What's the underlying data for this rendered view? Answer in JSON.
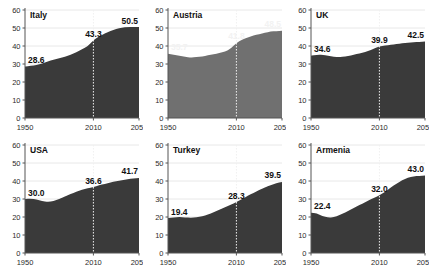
{
  "chart_data": {
    "type": "area",
    "title": "",
    "xlabel": "",
    "ylabel": "",
    "xlim": [
      1950,
      2050
    ],
    "ylim": [
      0,
      60
    ],
    "grid": true,
    "legend": "none",
    "xticks": [
      "1950",
      "2010",
      "2050"
    ],
    "xtick_values": [
      1950,
      2010,
      2050
    ],
    "yticks": [
      "0",
      "10",
      "20",
      "30",
      "40",
      "50",
      "60"
    ],
    "ytick_values": [
      0,
      10,
      20,
      30,
      40,
      50,
      60
    ],
    "reference_line_year": 2010,
    "label_years": [
      1950,
      2010,
      2050
    ],
    "colors": {
      "fill_dark": "#3a3a3a",
      "fill_light": "#707070",
      "label_dark": "#111111",
      "label_light": "#f2f2f2",
      "axis": "#555555",
      "grid": "#e8e8e8",
      "refline": "#f0f0f0"
    },
    "panels": [
      {
        "name": "Italy",
        "fill": "#3a3a3a",
        "label_color": "#111111",
        "labels": [
          "28.6",
          "43.3",
          "50.5"
        ],
        "label_values": [
          28.6,
          43.3,
          50.5
        ],
        "x": [
          1950,
          1955,
          1960,
          1965,
          1970,
          1975,
          1980,
          1985,
          1990,
          1995,
          2000,
          2005,
          2010,
          2015,
          2020,
          2025,
          2030,
          2035,
          2040,
          2045,
          2050
        ],
        "y": [
          28.6,
          29.0,
          29.4,
          30.2,
          31.4,
          32.4,
          33.2,
          34.0,
          35.2,
          36.6,
          38.2,
          39.8,
          43.3,
          45.3,
          47.0,
          48.3,
          49.4,
          50.2,
          50.6,
          50.6,
          50.5
        ]
      },
      {
        "name": "Austria",
        "fill": "#707070",
        "label_color": "#f2f2f2",
        "labels": [
          "35.7",
          "41.8",
          "48.5"
        ],
        "label_values": [
          35.7,
          41.8,
          48.5
        ],
        "x": [
          1950,
          1955,
          1960,
          1965,
          1970,
          1975,
          1980,
          1985,
          1990,
          1995,
          2000,
          2005,
          2010,
          2015,
          2020,
          2025,
          2030,
          2035,
          2040,
          2045,
          2050
        ],
        "y": [
          35.7,
          35.2,
          34.6,
          34.0,
          33.6,
          33.8,
          34.2,
          34.8,
          35.4,
          36.0,
          37.0,
          38.4,
          41.8,
          43.6,
          44.8,
          45.8,
          46.6,
          47.4,
          48.0,
          48.3,
          48.5
        ]
      },
      {
        "name": "UK",
        "fill": "#3a3a3a",
        "label_color": "#111111",
        "labels": [
          "34.6",
          "39.9",
          "42.5"
        ],
        "label_values": [
          34.6,
          39.9,
          42.5
        ],
        "x": [
          1950,
          1955,
          1960,
          1965,
          1970,
          1975,
          1980,
          1985,
          1990,
          1995,
          2000,
          2005,
          2010,
          2015,
          2020,
          2025,
          2030,
          2035,
          2040,
          2045,
          2050
        ],
        "y": [
          34.6,
          35.0,
          35.2,
          34.6,
          34.0,
          33.8,
          34.2,
          34.8,
          35.6,
          36.2,
          37.2,
          38.4,
          39.9,
          40.2,
          40.6,
          41.0,
          41.4,
          41.8,
          42.1,
          42.3,
          42.5
        ]
      },
      {
        "name": "USA",
        "fill": "#3a3a3a",
        "label_color": "#111111",
        "labels": [
          "30.0",
          "36.6",
          "41.7"
        ],
        "label_values": [
          30.0,
          36.6,
          41.7
        ],
        "x": [
          1950,
          1955,
          1960,
          1965,
          1970,
          1975,
          1980,
          1985,
          1990,
          1995,
          2000,
          2005,
          2010,
          2015,
          2020,
          2025,
          2030,
          2035,
          2040,
          2045,
          2050
        ],
        "y": [
          30.0,
          30.2,
          29.8,
          28.9,
          28.4,
          28.8,
          30.0,
          31.4,
          32.8,
          34.0,
          35.2,
          36.0,
          36.6,
          37.6,
          38.4,
          39.2,
          39.9,
          40.5,
          41.0,
          41.4,
          41.7
        ]
      },
      {
        "name": "Turkey",
        "fill": "#3a3a3a",
        "label_color": "#111111",
        "labels": [
          "19.4",
          "28.3",
          "39.5"
        ],
        "label_values": [
          19.4,
          28.3,
          39.5
        ],
        "x": [
          1950,
          1955,
          1960,
          1965,
          1970,
          1975,
          1980,
          1985,
          1990,
          1995,
          2000,
          2005,
          2010,
          2015,
          2020,
          2025,
          2030,
          2035,
          2040,
          2045,
          2050
        ],
        "y": [
          19.4,
          19.8,
          20.0,
          19.8,
          19.6,
          19.8,
          20.4,
          21.4,
          22.6,
          24.0,
          25.4,
          26.8,
          28.3,
          30.0,
          31.8,
          33.4,
          35.0,
          36.4,
          37.7,
          38.7,
          39.5
        ]
      },
      {
        "name": "Armenia",
        "fill": "#3a3a3a",
        "label_color": "#111111",
        "labels": [
          "22.4",
          "32.0",
          "43.0"
        ],
        "label_values": [
          22.4,
          32.0,
          43.0
        ],
        "x": [
          1950,
          1955,
          1960,
          1965,
          1970,
          1975,
          1980,
          1985,
          1990,
          1995,
          2000,
          2005,
          2010,
          2015,
          2020,
          2025,
          2030,
          2035,
          2040,
          2045,
          2050
        ],
        "y": [
          22.4,
          22.0,
          20.6,
          19.6,
          19.8,
          21.0,
          22.6,
          24.2,
          25.8,
          27.4,
          29.0,
          30.6,
          32.0,
          34.0,
          36.4,
          38.6,
          40.4,
          41.8,
          42.6,
          42.9,
          43.0
        ]
      }
    ]
  }
}
